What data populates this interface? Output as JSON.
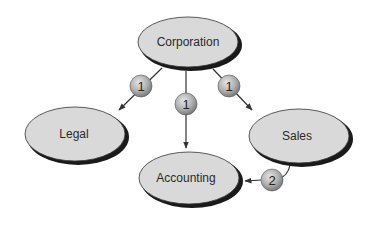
{
  "diagram": {
    "nodes": [
      {
        "id": "corporation",
        "label": "Corporation"
      },
      {
        "id": "legal",
        "label": "Legal"
      },
      {
        "id": "accounting",
        "label": "Accounting"
      },
      {
        "id": "sales",
        "label": "Sales"
      }
    ],
    "edges": [
      {
        "from": "corporation",
        "to": "legal",
        "badge": "1"
      },
      {
        "from": "corporation",
        "to": "accounting",
        "badge": "1"
      },
      {
        "from": "corporation",
        "to": "sales",
        "badge": "1"
      },
      {
        "from": "sales",
        "to": "accounting",
        "badge": "2"
      }
    ],
    "colors": {
      "node_fill": "#d9d9d9",
      "node_shadow": "#1a1a1a",
      "badge_fill": "#a8a8a8",
      "line": "#333333"
    }
  }
}
